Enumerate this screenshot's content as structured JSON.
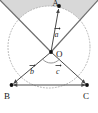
{
  "figure": {
    "canvas": {
      "width": 98,
      "height": 113,
      "background": "#ffffff"
    },
    "colors": {
      "stroke": "#555555",
      "point": "#111111",
      "circle": "#b0b0b0",
      "shade": "#d6d6d6",
      "text": "#1a1a1a",
      "ray": "#6a6a6a"
    },
    "circle": {
      "cx": 49,
      "cy": 47,
      "r": 41,
      "style": "dotted",
      "label": "circumcircle"
    },
    "shaded_region": {
      "fill": "#d6d6d6",
      "description": "wedge between the two upward rays from O, above the circle arc"
    },
    "points": [
      {
        "name": "A",
        "label": "A",
        "x": 59,
        "y": 6,
        "label_x": 57,
        "label_y": 5
      },
      {
        "name": "O",
        "label": "O",
        "x": 51,
        "y": 52,
        "label_x": 56,
        "label_y": 56
      },
      {
        "name": "B",
        "label": "B",
        "x": 11,
        "y": 85,
        "label_x": 5,
        "label_y": 97
      },
      {
        "name": "C",
        "label": "C",
        "x": 88,
        "y": 85,
        "label_x": 86,
        "label_y": 97
      }
    ],
    "vectors": [
      {
        "name": "a",
        "label": "a",
        "from": "O",
        "to": "A",
        "label_x": 57,
        "label_y": 34,
        "accent": "arrow"
      },
      {
        "name": "b",
        "label": "b",
        "from": "O",
        "to": "B",
        "label_x": 32,
        "label_y": 73,
        "accent": "arrow"
      },
      {
        "name": "c",
        "label": "c",
        "from": "O",
        "to": "C",
        "label_x": 58,
        "label_y": 73,
        "accent": "arrow"
      }
    ],
    "segments": [
      {
        "name": "BC",
        "from": "B",
        "to": "C",
        "arrows": "both"
      }
    ],
    "rays": [
      {
        "name": "ray-up-left",
        "from": "O",
        "toward_x": 0,
        "toward_y": 0
      },
      {
        "name": "ray-up-right",
        "from": "O",
        "toward_x": 98,
        "toward_y": 0
      }
    ],
    "angle_marks": [
      {
        "name": "angle-BOC",
        "at": "O",
        "between": [
          "b",
          "c"
        ]
      }
    ]
  }
}
